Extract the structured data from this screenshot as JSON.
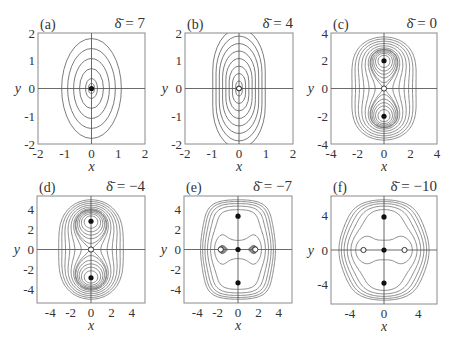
{
  "chart_data": [
    {
      "type": "contour",
      "label": "(a)",
      "delta_label": "δ̄ = 7",
      "delta": 7,
      "xlabel": "x",
      "ylabel": "y",
      "xlim": [
        -2,
        2
      ],
      "ylim": [
        -2,
        2
      ],
      "xticks": [
        -2,
        -1,
        0,
        1,
        2
      ],
      "yticks": [
        -2,
        -1,
        0,
        1,
        2
      ],
      "contour_levels": [
        0.1,
        0.2,
        0.4,
        0.6,
        0.8,
        1.0
      ],
      "aspect": 0.62,
      "stable_points": [
        [
          0,
          0
        ]
      ],
      "saddle_points": []
    },
    {
      "type": "contour",
      "label": "(b)",
      "delta_label": "δ̄ = 4",
      "delta": 4,
      "xlabel": "x",
      "ylabel": "y",
      "xlim": [
        -2,
        2
      ],
      "ylim": [
        -2,
        2
      ],
      "xticks": [
        -2,
        -1,
        0,
        1,
        2
      ],
      "yticks": [
        -2,
        -1,
        0,
        1,
        2
      ],
      "contour_levels": [
        0.15,
        0.3,
        0.45,
        0.6,
        0.75,
        0.9,
        1.05,
        1.2
      ],
      "aspect": 0.45,
      "stable_points": [
        [
          0,
          0
        ]
      ],
      "saddle_points": []
    },
    {
      "type": "contour",
      "label": "(c)",
      "delta_label": "δ̄ = 0",
      "delta": 0,
      "xlabel": "x",
      "ylabel": "y",
      "xlim": [
        -4,
        4
      ],
      "ylim": [
        -4,
        4
      ],
      "xticks": [
        -4,
        -2,
        0,
        2,
        4
      ],
      "yticks": [
        -4,
        -2,
        0,
        2,
        4
      ],
      "stable_points": [
        [
          0,
          2
        ],
        [
          0,
          -2
        ]
      ],
      "saddle_points": [
        [
          0,
          0
        ]
      ]
    },
    {
      "type": "contour",
      "label": "(d)",
      "delta_label": "δ̄ = −4",
      "delta": -4,
      "xlabel": "x",
      "ylabel": "y",
      "xlim": [
        -5.3,
        5.3
      ],
      "ylim": [
        -5.3,
        5.3
      ],
      "xticks": [
        -4,
        -2,
        0,
        2,
        4
      ],
      "yticks": [
        -4,
        -2,
        0,
        2,
        4
      ],
      "stable_points": [
        [
          0,
          2.8
        ],
        [
          0,
          -2.8
        ]
      ],
      "saddle_points": [
        [
          0,
          0
        ]
      ]
    },
    {
      "type": "contour",
      "label": "(e)",
      "delta_label": "δ̄ = −7",
      "delta": -7,
      "xlabel": "x",
      "ylabel": "y",
      "xlim": [
        -5.3,
        5.3
      ],
      "ylim": [
        -5.3,
        5.3
      ],
      "xticks": [
        -4,
        -2,
        0,
        2,
        4
      ],
      "yticks": [
        -4,
        -2,
        0,
        2,
        4
      ],
      "stable_points": [
        [
          0,
          3.3
        ],
        [
          0,
          0
        ],
        [
          0,
          -3.3
        ]
      ],
      "saddle_points": [
        [
          -1.7,
          0
        ],
        [
          1.7,
          0
        ]
      ]
    },
    {
      "type": "contour",
      "label": "(f)",
      "delta_label": "δ̄ = −10",
      "delta": -10,
      "xlabel": "x",
      "ylabel": "y",
      "xlim": [
        -6.2,
        6.2
      ],
      "ylim": [
        -6.2,
        6.2
      ],
      "xticks": [
        -4,
        0,
        4
      ],
      "yticks": [
        -4,
        0,
        4
      ],
      "stable_points": [
        [
          0,
          3.8
        ],
        [
          0,
          0
        ],
        [
          0,
          -3.8
        ]
      ],
      "saddle_points": [
        [
          -2.4,
          0
        ],
        [
          2.4,
          0
        ]
      ]
    }
  ]
}
